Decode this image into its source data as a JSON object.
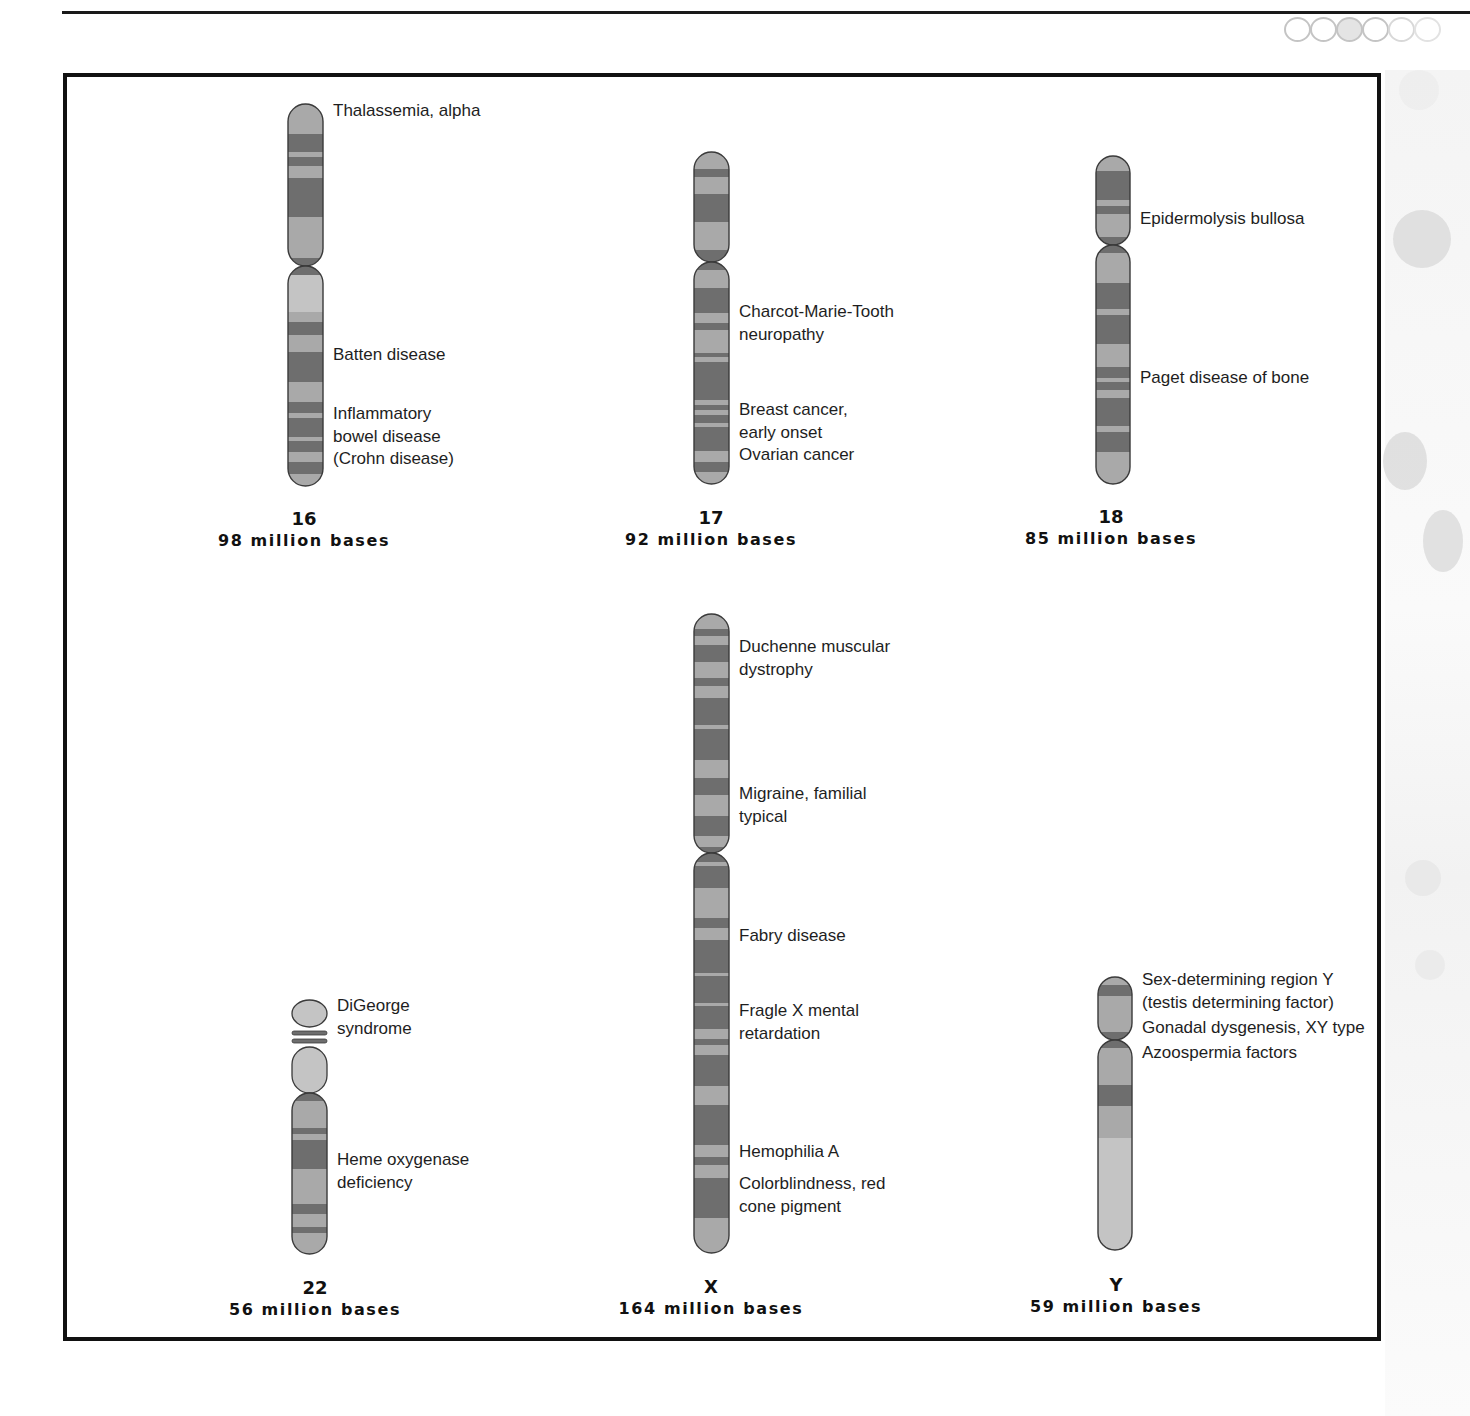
{
  "colors": {
    "band_light": "#a9a9a9",
    "band_pale": "#c4c4c4",
    "band_dark": "#6e6e6e",
    "band_mid": "#8c8c8c",
    "outline": "#3a3a3a",
    "frame": "#111111"
  },
  "chromosomes": [
    {
      "id": "16",
      "number": "16",
      "size": "98 million bases",
      "x": 288,
      "top": 104,
      "width": 35,
      "centromere": 266,
      "bottom": 486,
      "caption_x": 304,
      "caption_y": 508,
      "bands": [
        [
          104,
          134,
          "l"
        ],
        [
          134,
          152,
          "d"
        ],
        [
          152,
          157,
          "l"
        ],
        [
          157,
          166,
          "d"
        ],
        [
          166,
          178,
          "l"
        ],
        [
          178,
          217,
          "d"
        ],
        [
          217,
          258,
          "l"
        ],
        [
          258,
          266,
          "d"
        ],
        [
          266,
          275,
          "d"
        ],
        [
          275,
          312,
          "p"
        ],
        [
          312,
          322,
          "l"
        ],
        [
          322,
          335,
          "d"
        ],
        [
          335,
          352,
          "l"
        ],
        [
          352,
          382,
          "d"
        ],
        [
          382,
          402,
          "l"
        ],
        [
          402,
          413,
          "d"
        ],
        [
          413,
          418,
          "l"
        ],
        [
          418,
          437,
          "d"
        ],
        [
          437,
          441,
          "l"
        ],
        [
          441,
          452,
          "d"
        ],
        [
          452,
          462,
          "l"
        ],
        [
          462,
          474,
          "d"
        ],
        [
          474,
          486,
          "l"
        ]
      ],
      "labels_left": [
        {
          "text": "MHC class II deficiency",
          "y": 282
        },
        {
          "text": "Fish-eye disease",
          "y": 386
        },
        {
          "text": "UV-induced skin\ndamage, vulnerability to",
          "y": 444
        }
      ],
      "labels_right": [
        {
          "text": "Thalassemia, alpha",
          "y": 100
        },
        {
          "text": "Batten disease",
          "y": 344
        },
        {
          "text": "Inflammatory\nbowel disease\n(Crohn disease)",
          "y": 403
        }
      ]
    },
    {
      "id": "17",
      "number": "17",
      "size": "92 million bases",
      "x": 694,
      "top": 152,
      "width": 35,
      "centromere": 262,
      "bottom": 484,
      "caption_x": 711,
      "caption_y": 507,
      "bands": [
        [
          152,
          169,
          "l"
        ],
        [
          169,
          177,
          "d"
        ],
        [
          177,
          194,
          "l"
        ],
        [
          194,
          222,
          "d"
        ],
        [
          222,
          250,
          "l"
        ],
        [
          250,
          262,
          "d"
        ],
        [
          262,
          270,
          "d"
        ],
        [
          270,
          288,
          "l"
        ],
        [
          288,
          313,
          "d"
        ],
        [
          313,
          323,
          "l"
        ],
        [
          323,
          330,
          "d"
        ],
        [
          330,
          353,
          "l"
        ],
        [
          353,
          357,
          "d"
        ],
        [
          357,
          362,
          "l"
        ],
        [
          362,
          400,
          "d"
        ],
        [
          400,
          405,
          "l"
        ],
        [
          405,
          410,
          "d"
        ],
        [
          410,
          415,
          "l"
        ],
        [
          415,
          423,
          "d"
        ],
        [
          423,
          427,
          "l"
        ],
        [
          427,
          451,
          "d"
        ],
        [
          451,
          462,
          "l"
        ],
        [
          462,
          472,
          "d"
        ],
        [
          472,
          484,
          "l"
        ]
      ],
      "labels_left": [
        {
          "text": "Canavan disease",
          "y": 150
        },
        {
          "text": "Osteogenesis\nimperfecta",
          "y": 440
        }
      ],
      "labels_right": [
        {
          "text": "Charcot-Marie-Tooth\nneuropathy",
          "y": 301
        },
        {
          "text": "Breast cancer,\nearly onset\nOvarian cancer",
          "y": 399
        }
      ]
    },
    {
      "id": "18",
      "number": "18",
      "size": "85 million bases",
      "x": 1096,
      "top": 156,
      "width": 34,
      "centromere": 245,
      "bottom": 484,
      "caption_x": 1111,
      "caption_y": 506,
      "bands": [
        [
          156,
          171,
          "l"
        ],
        [
          171,
          200,
          "d"
        ],
        [
          200,
          206,
          "l"
        ],
        [
          206,
          214,
          "d"
        ],
        [
          214,
          237,
          "l"
        ],
        [
          237,
          245,
          "d"
        ],
        [
          245,
          253,
          "d"
        ],
        [
          253,
          283,
          "l"
        ],
        [
          283,
          309,
          "d"
        ],
        [
          309,
          315,
          "l"
        ],
        [
          315,
          344,
          "d"
        ],
        [
          344,
          367,
          "l"
        ],
        [
          367,
          378,
          "d"
        ],
        [
          378,
          382,
          "l"
        ],
        [
          382,
          390,
          "d"
        ],
        [
          390,
          398,
          "l"
        ],
        [
          398,
          426,
          "d"
        ],
        [
          426,
          432,
          "l"
        ],
        [
          432,
          452,
          "d"
        ],
        [
          452,
          484,
          "l"
        ]
      ],
      "labels_left": [
        {
          "text": "Pancreatic cancer",
          "y": 321
        },
        {
          "text": "Combined factor\nV and VIII deficiency",
          "y": 397
        }
      ],
      "labels_right": [
        {
          "text": "Epidermolysis bullosa",
          "y": 208
        },
        {
          "text": "Paget disease of bone",
          "y": 367
        }
      ]
    },
    {
      "id": "22",
      "number": "22",
      "size": "56 million bases",
      "x": 292,
      "top": 1000,
      "width": 35,
      "centromere": 1093,
      "bottom": 1254,
      "caption_x": 315,
      "caption_y": 1277,
      "style": "acrocentric",
      "bands": [
        [
          1093,
          1101,
          "d"
        ],
        [
          1101,
          1128,
          "l"
        ],
        [
          1128,
          1134,
          "d"
        ],
        [
          1134,
          1140,
          "l"
        ],
        [
          1140,
          1169,
          "d"
        ],
        [
          1169,
          1204,
          "l"
        ],
        [
          1204,
          1214,
          "d"
        ],
        [
          1214,
          1227,
          "l"
        ],
        [
          1227,
          1233,
          "d"
        ],
        [
          1233,
          1254,
          "l"
        ]
      ],
      "labels_left": [
        {
          "text": "Cat eye syndrome",
          "y": 995
        },
        {
          "text": "Ewing sarcoma",
          "y": 1135
        }
      ],
      "labels_right": [
        {
          "text": "DiGeorge\nsyndrome",
          "y": 995
        },
        {
          "text": "Heme oxygenase\ndeficiency",
          "y": 1149
        }
      ]
    },
    {
      "id": "X",
      "number": "X",
      "size": "164 million bases",
      "x": 694,
      "top": 614,
      "width": 35,
      "centromere": 853,
      "bottom": 1253,
      "caption_x": 711,
      "caption_y": 1276,
      "bands": [
        [
          614,
          629,
          "l"
        ],
        [
          629,
          636,
          "d"
        ],
        [
          636,
          645,
          "l"
        ],
        [
          645,
          662,
          "d"
        ],
        [
          662,
          678,
          "l"
        ],
        [
          678,
          686,
          "d"
        ],
        [
          686,
          698,
          "l"
        ],
        [
          698,
          725,
          "d"
        ],
        [
          725,
          729,
          "l"
        ],
        [
          729,
          760,
          "d"
        ],
        [
          760,
          778,
          "l"
        ],
        [
          778,
          795,
          "d"
        ],
        [
          795,
          816,
          "l"
        ],
        [
          816,
          836,
          "d"
        ],
        [
          836,
          847,
          "l"
        ],
        [
          847,
          853,
          "d"
        ],
        [
          853,
          862,
          "d"
        ],
        [
          862,
          866,
          "l"
        ],
        [
          866,
          888,
          "d"
        ],
        [
          888,
          918,
          "l"
        ],
        [
          918,
          928,
          "d"
        ],
        [
          928,
          940,
          "l"
        ],
        [
          940,
          973,
          "d"
        ],
        [
          973,
          976,
          "l"
        ],
        [
          976,
          1003,
          "d"
        ],
        [
          1003,
          1006,
          "l"
        ],
        [
          1006,
          1029,
          "d"
        ],
        [
          1029,
          1039,
          "l"
        ],
        [
          1039,
          1045,
          "d"
        ],
        [
          1045,
          1055,
          "l"
        ],
        [
          1055,
          1086,
          "d"
        ],
        [
          1086,
          1105,
          "l"
        ],
        [
          1105,
          1145,
          "d"
        ],
        [
          1145,
          1157,
          "l"
        ],
        [
          1157,
          1165,
          "d"
        ],
        [
          1165,
          1178,
          "l"
        ],
        [
          1178,
          1218,
          "d"
        ],
        [
          1218,
          1253,
          "l"
        ]
      ],
      "labels_left": [
        {
          "text": "Pyruvate dehydrogenase\ndeficiency",
          "y": 606
        },
        {
          "text": "Night blindness, congenital\nstationary, type 1",
          "y": 684
        },
        {
          "text": "Night blindness, congenital\nstationary, type 2",
          "y": 747
        },
        {
          "text": "X-inactivation center",
          "y": 826
        },
        {
          "text": "Hypertrichosis, congenital\ngeneralized",
          "y": 882
        },
        {
          "text": "Lesch-Nyhan syndrome",
          "y": 963
        },
        {
          "text": "Hemophilia B",
          "y": 1040
        },
        {
          "text": "Colorblindness, blue\nmonochromatic",
          "y": 1075
        },
        {
          "text": "Colorblindness, green\ncone pigment",
          "y": 1146
        },
        {
          "text": "Rett syndrome",
          "y": 1228
        }
      ],
      "labels_right": [
        {
          "text": "Duchenne muscular\ndystrophy",
          "y": 636
        },
        {
          "text": "Migraine, familial\n typical",
          "y": 783
        },
        {
          "text": "Fabry disease",
          "y": 925
        },
        {
          "text": "Fragle X mental\nretardation",
          "y": 1000
        },
        {
          "text": "Hemophilia A",
          "y": 1141
        },
        {
          "text": "Colorblindness, red\ncone pigment",
          "y": 1173
        }
      ]
    },
    {
      "id": "Y",
      "number": "Y",
      "size": "59 million bases",
      "x": 1098,
      "top": 977,
      "width": 34,
      "centromere": 1040,
      "bottom": 1250,
      "caption_x": 1116,
      "caption_y": 1274,
      "bands": [
        [
          977,
          985,
          "l"
        ],
        [
          985,
          996,
          "d"
        ],
        [
          996,
          1032,
          "l"
        ],
        [
          1032,
          1040,
          "d"
        ],
        [
          1040,
          1048,
          "d"
        ],
        [
          1048,
          1085,
          "l"
        ],
        [
          1085,
          1106,
          "d"
        ],
        [
          1106,
          1138,
          "l"
        ],
        [
          1138,
          1250,
          "p"
        ]
      ],
      "labels_left": [],
      "labels_right": [
        {
          "text": "Sex-determining region Y\n(testis determining factor)",
          "y": 969
        },
        {
          "text": "Gonadal dysgenesis, XY type",
          "y": 1017
        },
        {
          "text": "Azoospermia factors",
          "y": 1042
        }
      ]
    }
  ]
}
